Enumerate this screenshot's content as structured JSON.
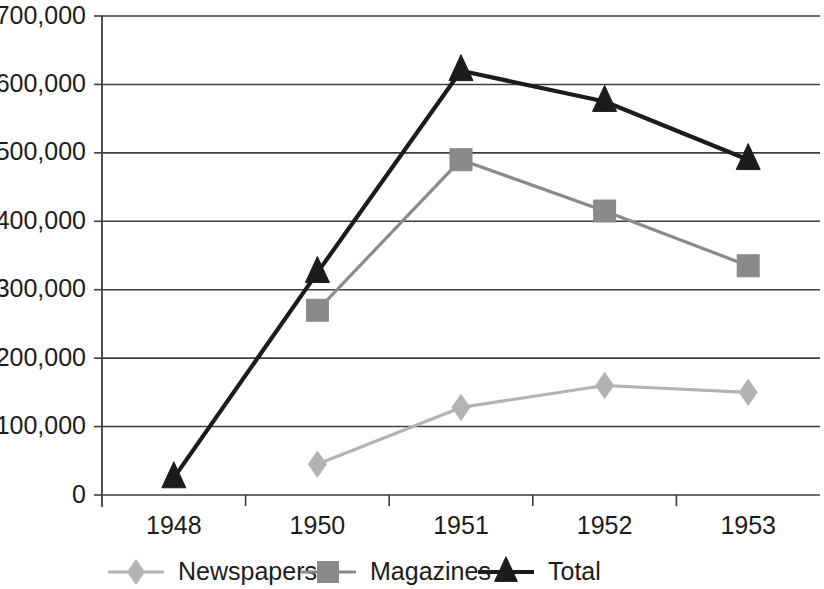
{
  "chart_data": {
    "type": "line",
    "title": "",
    "subtitle": "",
    "xlabel": "",
    "ylabel": "",
    "categories": [
      "1948",
      "1950",
      "1951",
      "1952",
      "1953"
    ],
    "series": [
      {
        "name": "Newspapers",
        "color": "#b3b3b3",
        "marker": "diamond",
        "values": [
          null,
          45000,
          128000,
          160000,
          150000
        ]
      },
      {
        "name": "Magazines",
        "color": "#8a8a8a",
        "marker": "square",
        "values": [
          null,
          270000,
          490000,
          415000,
          335000
        ]
      },
      {
        "name": "Total",
        "color": "#1c1c1c",
        "marker": "triangle",
        "values": [
          25000,
          325000,
          620000,
          575000,
          490000
        ]
      }
    ],
    "ylim": [
      0,
      700000
    ],
    "ytick_values": [
      0,
      100000,
      200000,
      300000,
      400000,
      500000,
      600000,
      700000
    ],
    "ytick_labels": [
      "0",
      "100,000",
      "200,000",
      "300,000",
      "400,000",
      "500,000",
      "600,000",
      "700,000"
    ],
    "grid": true,
    "grid_axis": "y",
    "legend_position": "bottom",
    "legend_entries": [
      {
        "label": "Newspapers",
        "color": "#b3b3b3",
        "marker": "diamond"
      },
      {
        "label": "Magazines",
        "color": "#8a8a8a",
        "marker": "square"
      },
      {
        "label": "Total",
        "color": "#1c1c1c",
        "marker": "triangle"
      }
    ]
  },
  "axis_colors": {
    "grid": "#3d3d3d",
    "axis": "#3d3d3d",
    "text": "#1c1c1c",
    "background": "#ffffff"
  }
}
